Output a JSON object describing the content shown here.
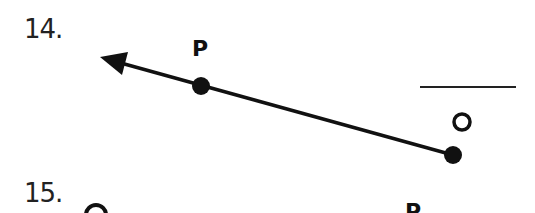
{
  "problems": [
    {
      "number": "14.",
      "figure": "ray",
      "points": [
        {
          "label": "P",
          "x": 201,
          "y": 86
        },
        {
          "label": "O",
          "x": 453,
          "y": 155
        }
      ],
      "arrow_tip": {
        "x": 100,
        "y": 57
      },
      "answer_blank": ""
    },
    {
      "number": "15.",
      "points": [
        {
          "label": "O"
        },
        {
          "label": "P"
        }
      ]
    }
  ],
  "colors": {
    "ink": "#111111",
    "background": "#ffffff"
  }
}
